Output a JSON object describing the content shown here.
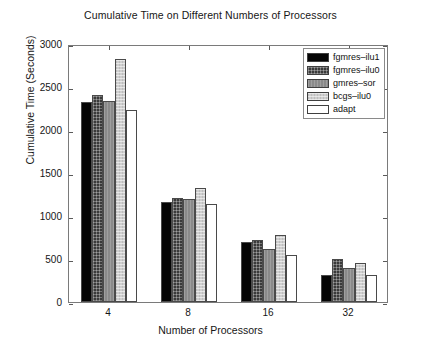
{
  "chart_data": {
    "type": "bar",
    "title": "Cumulative Time on Different Numbers of Processors",
    "xlabel": "Number of Processors",
    "ylabel": "Cumulative Time (Seconds)",
    "categories": [
      "4",
      "8",
      "16",
      "32"
    ],
    "ylim": [
      0,
      3000
    ],
    "yticks": [
      0,
      500,
      1000,
      1500,
      2000,
      2500,
      3000
    ],
    "ytick_labels": [
      "0",
      "500",
      "1000",
      "1500",
      "2000",
      "2500",
      "3000"
    ],
    "grid": false,
    "legend_position": "top-right",
    "series": [
      {
        "name": "fgmres–ilu1",
        "fill": "solid-black",
        "color": "#050505",
        "values": [
          2320,
          1165,
          700,
          310
        ]
      },
      {
        "name": "fgmres–ilu0",
        "fill": "dark-crosshatch",
        "color": "#3a3a3a",
        "values": [
          2410,
          1215,
          725,
          500
        ]
      },
      {
        "name": "gmres–sor",
        "fill": "medium-gray",
        "color": "#8a8a8a",
        "values": [
          2340,
          1195,
          615,
          390
        ]
      },
      {
        "name": "bcgs–ilu0",
        "fill": "light-stipple",
        "color": "#cfcfcf",
        "values": [
          2820,
          1330,
          780,
          455
        ]
      },
      {
        "name": "adapt",
        "fill": "white",
        "color": "#ffffff",
        "values": [
          2230,
          1135,
          545,
          310
        ]
      }
    ]
  },
  "legend": {
    "items": [
      {
        "label": "fgmres–ilu1"
      },
      {
        "label": "fgmres–ilu0"
      },
      {
        "label": "gmres–sor"
      },
      {
        "label": "bcgs–ilu0"
      },
      {
        "label": "adapt"
      }
    ]
  },
  "axes": {
    "y_labels": [
      "3000",
      "2500",
      "2000",
      "1500",
      "1000",
      "500",
      "0"
    ],
    "x_labels": [
      "4",
      "8",
      "16",
      "32"
    ]
  }
}
